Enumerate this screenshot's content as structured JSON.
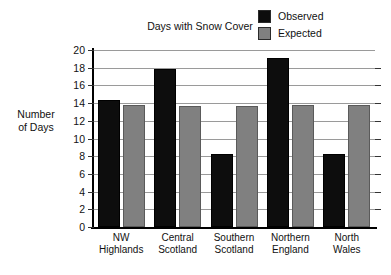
{
  "chart_data": {
    "type": "bar",
    "title": "Days with Snow Cover",
    "xlabel": "",
    "ylabel": "Number of Days",
    "ylabel_lines": [
      "Number",
      "of Days"
    ],
    "ylim": [
      0,
      20
    ],
    "ytick_step": 2,
    "ytick_labels": [
      "20",
      "18",
      "16",
      "14",
      "12",
      "10",
      "8",
      "6",
      "4",
      "2",
      "0"
    ],
    "ytick_values": [
      20,
      18,
      16,
      14,
      12,
      10,
      8,
      6,
      4,
      2,
      0
    ],
    "grid": true,
    "legend_position": "top-right",
    "categories": [
      "NW Highlands",
      "Central Scotland",
      "Southern Scotland",
      "Northern England",
      "North Wales"
    ],
    "category_lines": [
      [
        "NW",
        "Highlands"
      ],
      [
        "Central",
        "Scotland"
      ],
      [
        "Southern",
        "Scotland"
      ],
      [
        "Northern",
        "England"
      ],
      [
        "North",
        "Wales"
      ]
    ],
    "series": [
      {
        "name": "Observed",
        "color": "#0d0d0d",
        "values": [
          14.3,
          17.8,
          8.3,
          19.1,
          8.3
        ]
      },
      {
        "name": "Expected",
        "color": "#808080",
        "values": [
          13.8,
          13.7,
          13.7,
          13.8,
          13.8
        ]
      }
    ]
  },
  "legend": {
    "items": [
      {
        "label": "Observed",
        "color": "#0d0d0d"
      },
      {
        "label": "Expected",
        "color": "#808080"
      }
    ]
  }
}
